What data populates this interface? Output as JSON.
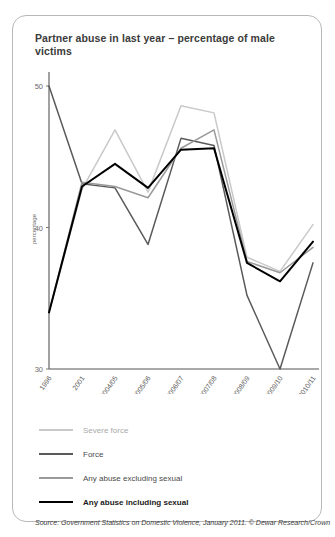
{
  "card": {
    "title": "Partner abuse in last year – percentage of male victims",
    "source": "Source: Government Statistics on Domestic Violence, January 2011. © Dewar Research/Crown"
  },
  "legend": [
    {
      "label": "Severe force",
      "color": "#c9c9c9",
      "width": 2.2,
      "bold": false
    },
    {
      "label": "Force",
      "color": "#5a5a5a",
      "width": 2.2,
      "bold": false
    },
    {
      "label": "Any abuse excluding sexual",
      "color": "#9a9a9a",
      "width": 2.2,
      "bold": false
    },
    {
      "label": "Any abuse including sexual",
      "color": "#000000",
      "width": 2.8,
      "bold": true
    }
  ],
  "chart_data": {
    "type": "line",
    "title": "Partner abuse in last year – percentage of male victims",
    "xlabel": "",
    "ylabel": "percentage",
    "ylim": [
      30,
      50
    ],
    "yticks": [
      30,
      40,
      50
    ],
    "grid": false,
    "legend_position": "below",
    "categories": [
      "1996",
      "2001",
      "2004/05",
      "2005/06",
      "2006/07",
      "2007/08",
      "2008/09",
      "2009/10",
      "2010/11"
    ],
    "series": [
      {
        "name": "Severe force",
        "color": "#c9c9c9",
        "values": [
          34.0,
          42.7,
          46.9,
          42.5,
          48.6,
          48.1,
          37.9,
          36.9,
          40.2
        ]
      },
      {
        "name": "Force",
        "color": "#5a5a5a",
        "values": [
          50.0,
          43.1,
          42.8,
          38.8,
          46.3,
          45.8,
          35.2,
          30.0,
          37.5
        ]
      },
      {
        "name": "Any abuse excluding sexual",
        "color": "#9a9a9a",
        "values": [
          34.0,
          43.2,
          42.9,
          42.1,
          45.6,
          46.9,
          37.6,
          36.8,
          38.6
        ]
      },
      {
        "name": "Any abuse including sexual",
        "color": "#000000",
        "values": [
          34.0,
          42.9,
          44.5,
          42.8,
          45.5,
          45.6,
          37.5,
          36.2,
          39.0
        ]
      }
    ]
  }
}
